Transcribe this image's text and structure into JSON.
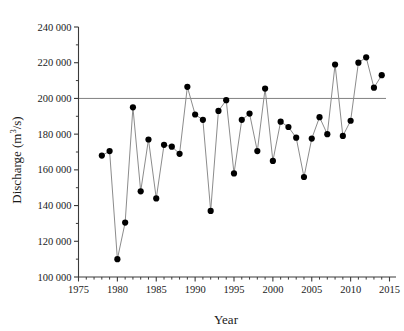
{
  "chart_data": {
    "type": "line",
    "title": "",
    "xlabel": "Year",
    "ylabel": "Discharge (m³/s)",
    "ylabel_parts": {
      "prefix": "Discharge (m",
      "superscript": "3",
      "suffix": "/s)"
    },
    "xlim": [
      1975,
      2016
    ],
    "ylim": [
      100000,
      240000
    ],
    "xticks": [
      1975,
      1980,
      1985,
      1990,
      1995,
      2000,
      2005,
      2010,
      2015
    ],
    "xtick_labels": [
      "1975",
      "1980",
      "1985",
      "1990",
      "1995",
      "2000",
      "2005",
      "2010",
      "2015"
    ],
    "x_minor_tick_interval": 1,
    "yticks": [
      100000,
      120000,
      140000,
      160000,
      180000,
      200000,
      220000,
      240000
    ],
    "ytick_labels": [
      "100 000",
      "120 000",
      "140 000",
      "160 000",
      "180 000",
      "200 000",
      "220 000",
      "240 000"
    ],
    "y_minor_tick_interval": 10000,
    "grid": false,
    "legend": null,
    "reference_line": {
      "value": 200000,
      "orientation": "horizontal",
      "color": "#808080",
      "label": ""
    },
    "marker": {
      "shape": "circle",
      "color": "#000000",
      "size": 5
    },
    "line": {
      "color": "#8c8c8c",
      "width": 1
    },
    "x": [
      1978,
      1979,
      1980,
      1981,
      1982,
      1983,
      1984,
      1985,
      1986,
      1987,
      1988,
      1989,
      1990,
      1991,
      1992,
      1993,
      1994,
      1995,
      1996,
      1997,
      1998,
      1999,
      2000,
      2001,
      2002,
      2003,
      2004,
      2005,
      2006,
      2007,
      2008,
      2009,
      2010,
      2011,
      2012,
      2013,
      2014
    ],
    "values": [
      168000,
      170500,
      110000,
      130500,
      195000,
      148000,
      177000,
      144000,
      174000,
      173000,
      169000,
      206500,
      191000,
      188000,
      137000,
      193000,
      199000,
      158000,
      188000,
      191500,
      170500,
      205500,
      165000,
      187000,
      184000,
      178000,
      156000,
      177500,
      189500,
      180000,
      219000,
      179000,
      187500,
      220000,
      223000,
      206000,
      213000
    ]
  },
  "axes": {
    "x_axis_name": "year-axis",
    "y_axis_name": "discharge-axis"
  }
}
